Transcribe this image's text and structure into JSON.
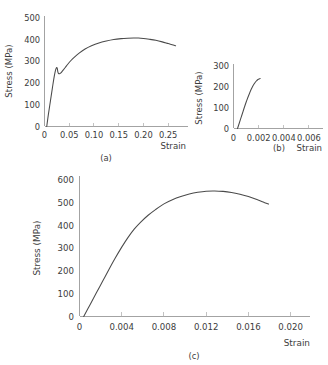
{
  "figure": {
    "background_color": "#ffffff",
    "curve_color": "#4a4a4a",
    "axis_color": "#8c8c8c",
    "text_color": "#3c3c3c"
  },
  "chart_data": [
    {
      "id": "a",
      "type": "line",
      "title": "",
      "caption": "(a)",
      "xlabel": "Strain",
      "ylabel": "Stress (MPa)",
      "xlim": [
        0,
        0.28
      ],
      "ylim": [
        0,
        500
      ],
      "grid": false,
      "legend": "none",
      "xticks": [
        0,
        0.05,
        0.1,
        0.15,
        0.2,
        0.25
      ],
      "xticklabels": [
        "0",
        "0.05",
        "0.10",
        "0.15",
        "0.20",
        "0.25"
      ],
      "yticks": [
        0,
        100,
        200,
        300,
        400,
        500
      ],
      "yticklabels": [
        "0",
        "100",
        "200",
        "300",
        "400",
        "500"
      ],
      "series": [
        {
          "name": "engineering stress-strain",
          "x": [
            0.0045,
            0.008,
            0.012,
            0.016,
            0.019,
            0.0215,
            0.0235,
            0.0248,
            0.0258,
            0.027,
            0.0285,
            0.0305,
            0.0325,
            0.035,
            0.038,
            0.042,
            0.047,
            0.053,
            0.06,
            0.07,
            0.082,
            0.095,
            0.11,
            0.125,
            0.14,
            0.155,
            0.168,
            0.18,
            0.19,
            0.2,
            0.212,
            0.225,
            0.238,
            0.25,
            0.258,
            0.265
          ],
          "y": [
            0,
            58,
            118,
            178,
            222,
            252,
            268,
            272,
            268,
            252,
            244,
            243,
            246,
            252,
            261,
            272,
            287,
            303,
            319,
            338,
            357,
            372,
            385,
            394,
            401,
            405,
            407,
            408,
            408,
            406,
            402,
            397,
            390,
            382,
            377,
            372
          ]
        }
      ]
    },
    {
      "id": "b",
      "type": "line",
      "title": "",
      "caption": "(b)",
      "xlabel": "Strain",
      "ylabel": "Stress (MPa)",
      "xlim": [
        0,
        0.0068
      ],
      "ylim": [
        0,
        300
      ],
      "grid": false,
      "legend": "none",
      "xticks": [
        0,
        0.002,
        0.004,
        0.006
      ],
      "xticklabels": [
        "0",
        "0.002",
        "0.004",
        "0.006"
      ],
      "yticks": [
        0,
        100,
        200,
        300
      ],
      "yticklabels": [
        "0",
        "100",
        "200",
        "300"
      ],
      "series": [
        {
          "name": "elastic region detail",
          "x": [
            0.00032,
            0.00045,
            0.0006,
            0.00075,
            0.0009,
            0.00105,
            0.00118,
            0.0013,
            0.00142,
            0.00152,
            0.00162,
            0.00172,
            0.00182,
            0.00192,
            0.002,
            0.00207,
            0.00212
          ],
          "y": [
            0,
            24,
            52,
            80,
            108,
            134,
            155,
            173,
            190,
            202,
            212,
            221,
            228,
            234,
            237,
            239,
            240
          ]
        }
      ]
    },
    {
      "id": "c",
      "type": "line",
      "title": "",
      "caption": "(c)",
      "xlabel": "Strain",
      "ylabel": "Stress (MPa)",
      "xlim": [
        0,
        0.0206
      ],
      "ylim": [
        0,
        600
      ],
      "grid": false,
      "legend": "none",
      "xticks": [
        0,
        0.004,
        0.008,
        0.012,
        0.016,
        0.02
      ],
      "xticklabels": [
        "0",
        "0.004",
        "0.008",
        "0.012",
        "0.016",
        "0.020"
      ],
      "yticks": [
        0,
        100,
        200,
        300,
        400,
        500,
        600
      ],
      "yticklabels": [
        "0",
        "100",
        "200",
        "300",
        "400",
        "500",
        "600"
      ],
      "series": [
        {
          "name": "stress-strain",
          "x": [
            0.0004,
            0.001,
            0.0016,
            0.0022,
            0.0028,
            0.0034,
            0.004,
            0.0046,
            0.0052,
            0.0058,
            0.0065,
            0.0072,
            0.008,
            0.0088,
            0.0096,
            0.0104,
            0.0112,
            0.012,
            0.0128,
            0.0136,
            0.0144,
            0.0152,
            0.016,
            0.0168,
            0.0174,
            0.0179
          ],
          "y": [
            0,
            52,
            104,
            156,
            208,
            258,
            305,
            348,
            385,
            415,
            445,
            470,
            495,
            513,
            527,
            538,
            546,
            551,
            552,
            550,
            545,
            537,
            527,
            514,
            503,
            494
          ]
        }
      ]
    }
  ]
}
